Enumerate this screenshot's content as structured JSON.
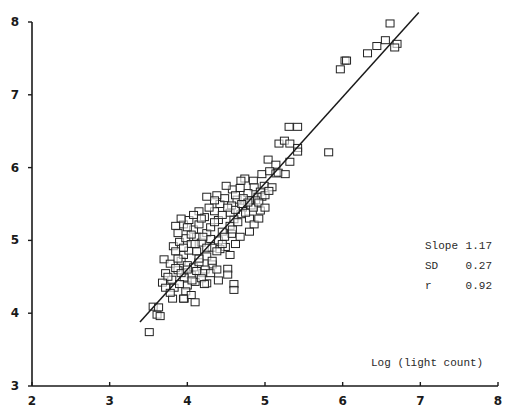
{
  "chart_data": {
    "type": "scatter",
    "title": "",
    "xlabel": "Log (light count)",
    "ylabel": "",
    "xlim": [
      2,
      8
    ],
    "ylim": [
      3,
      8
    ],
    "xticks": [
      2,
      3,
      4,
      5,
      6,
      7,
      8
    ],
    "yticks": [
      3,
      4,
      5,
      6,
      7,
      8
    ],
    "grid": false,
    "legend": null,
    "marker": "open-square",
    "regression_line": {
      "x": [
        3.39,
        6.98
      ],
      "y": [
        3.88,
        8.13
      ],
      "slope": 1.17
    },
    "annotations": [
      {
        "label": "Slope",
        "value": "1.17"
      },
      {
        "label": "SD",
        "value": "0.27"
      },
      {
        "label": "r",
        "value": "0.92"
      }
    ],
    "points": [
      [
        6.61,
        7.98
      ],
      [
        6.55,
        7.75
      ],
      [
        6.7,
        7.7
      ],
      [
        6.67,
        7.65
      ],
      [
        6.44,
        7.67
      ],
      [
        6.32,
        7.57
      ],
      [
        6.03,
        7.47
      ],
      [
        6.05,
        7.47
      ],
      [
        5.97,
        7.35
      ],
      [
        5.31,
        6.56
      ],
      [
        5.42,
        6.56
      ],
      [
        5.18,
        6.33
      ],
      [
        5.25,
        6.37
      ],
      [
        5.32,
        6.33
      ],
      [
        5.42,
        6.27
      ],
      [
        5.42,
        6.22
      ],
      [
        5.82,
        6.21
      ],
      [
        5.04,
        6.11
      ],
      [
        5.14,
        6.04
      ],
      [
        5.32,
        6.08
      ],
      [
        4.96,
        5.91
      ],
      [
        5.06,
        5.95
      ],
      [
        5.14,
        5.92
      ],
      [
        5.17,
        5.93
      ],
      [
        5.26,
        5.91
      ],
      [
        4.74,
        5.85
      ],
      [
        4.85,
        5.82
      ],
      [
        4.69,
        5.82
      ],
      [
        4.86,
        5.73
      ],
      [
        4.99,
        5.75
      ],
      [
        4.94,
        5.67
      ],
      [
        5.09,
        5.73
      ],
      [
        4.91,
        5.6
      ],
      [
        4.96,
        5.6
      ],
      [
        4.58,
        5.7
      ],
      [
        4.64,
        5.56
      ],
      [
        4.78,
        5.65
      ],
      [
        4.88,
        5.55
      ],
      [
        4.94,
        5.41
      ],
      [
        4.82,
        5.48
      ],
      [
        4.57,
        5.48
      ],
      [
        4.71,
        5.45
      ],
      [
        4.8,
        5.3
      ],
      [
        4.8,
        5.55
      ],
      [
        4.86,
        5.22
      ],
      [
        4.69,
        5.36
      ],
      [
        4.6,
        5.29
      ],
      [
        4.57,
        5.09
      ],
      [
        4.49,
        4.91
      ],
      [
        4.32,
        4.9
      ],
      [
        4.42,
        4.88
      ],
      [
        4.52,
        4.61
      ],
      [
        4.52,
        4.53
      ],
      [
        4.32,
        4.67
      ],
      [
        4.23,
        4.6
      ],
      [
        3.51,
        3.74
      ],
      [
        3.56,
        4.09
      ],
      [
        3.61,
        3.98
      ],
      [
        3.65,
        3.96
      ],
      [
        3.63,
        4.08
      ],
      [
        3.81,
        4.2
      ],
      [
        3.96,
        4.2
      ],
      [
        4.6,
        4.4
      ],
      [
        4.6,
        4.32
      ],
      [
        4.25,
        4.41
      ],
      [
        4.05,
        4.53
      ],
      [
        3.8,
        4.46
      ],
      [
        3.72,
        4.55
      ],
      [
        3.88,
        4.59
      ],
      [
        3.96,
        4.49
      ],
      [
        4.1,
        4.43
      ],
      [
        3.7,
        4.74
      ],
      [
        3.78,
        4.68
      ],
      [
        3.85,
        4.62
      ],
      [
        3.92,
        4.72
      ],
      [
        4.0,
        4.66
      ],
      [
        4.08,
        4.63
      ],
      [
        4.15,
        4.7
      ],
      [
        4.2,
        4.55
      ],
      [
        3.95,
        4.8
      ],
      [
        4.02,
        4.86
      ],
      [
        3.82,
        4.92
      ],
      [
        3.9,
        4.98
      ],
      [
        3.98,
        5.03
      ],
      [
        4.05,
        4.95
      ],
      [
        4.12,
        5.05
      ],
      [
        4.18,
        4.97
      ],
      [
        4.25,
        5.1
      ],
      [
        4.08,
        5.15
      ],
      [
        3.88,
        5.1
      ],
      [
        3.95,
        5.22
      ],
      [
        4.02,
        5.28
      ],
      [
        4.15,
        5.22
      ],
      [
        4.22,
        5.32
      ],
      [
        4.3,
        5.18
      ],
      [
        4.35,
        5.4
      ],
      [
        4.4,
        5.28
      ],
      [
        4.45,
        5.12
      ],
      [
        4.28,
        5.45
      ],
      [
        4.15,
        5.4
      ],
      [
        4.42,
        5.5
      ],
      [
        4.48,
        5.58
      ],
      [
        4.55,
        5.38
      ],
      [
        4.38,
        5.62
      ],
      [
        4.5,
        5.75
      ],
      [
        4.62,
        5.62
      ],
      [
        4.68,
        5.72
      ],
      [
        4.72,
        5.58
      ],
      [
        4.3,
        5.02
      ],
      [
        4.38,
        4.85
      ],
      [
        4.12,
        4.85
      ],
      [
        3.75,
        4.5
      ],
      [
        3.83,
        4.35
      ],
      [
        3.9,
        4.4
      ],
      [
        4.0,
        4.38
      ],
      [
        4.06,
        4.45
      ],
      [
        3.92,
        4.55
      ],
      [
        4.0,
        4.6
      ],
      [
        4.12,
        4.58
      ],
      [
        4.18,
        4.48
      ],
      [
        3.98,
        4.3
      ],
      [
        3.68,
        4.42
      ],
      [
        3.72,
        4.35
      ],
      [
        3.78,
        4.28
      ],
      [
        4.1,
        4.95
      ],
      [
        4.2,
        5.05
      ],
      [
        4.35,
        5.25
      ],
      [
        4.45,
        5.35
      ],
      [
        4.55,
        5.2
      ],
      [
        4.62,
        5.42
      ],
      [
        4.4,
        5.0
      ],
      [
        4.05,
        5.08
      ],
      [
        3.85,
        4.85
      ],
      [
        3.95,
        4.9
      ],
      [
        4.25,
        4.78
      ],
      [
        4.32,
        4.72
      ],
      [
        4.48,
        5.05
      ],
      [
        4.58,
        5.15
      ],
      [
        4.65,
        5.25
      ],
      [
        4.75,
        5.38
      ],
      [
        4.85,
        5.45
      ],
      [
        4.92,
        5.52
      ],
      [
        5.0,
        5.62
      ],
      [
        5.05,
        5.68
      ],
      [
        4.78,
        5.52
      ],
      [
        4.7,
        5.5
      ],
      [
        4.52,
        5.45
      ],
      [
        4.35,
        5.55
      ],
      [
        4.25,
        5.6
      ],
      [
        4.18,
        5.3
      ],
      [
        4.08,
        5.35
      ],
      [
        4.0,
        5.18
      ],
      [
        3.92,
        5.3
      ],
      [
        3.85,
        5.2
      ],
      [
        3.88,
        4.75
      ],
      [
        4.15,
        4.75
      ],
      [
        4.25,
        4.9
      ],
      [
        4.45,
        4.95
      ],
      [
        4.55,
        4.8
      ],
      [
        4.68,
        5.05
      ],
      [
        4.3,
        4.55
      ],
      [
        4.38,
        4.6
      ],
      [
        4.22,
        4.4
      ],
      [
        4.05,
        4.25
      ],
      [
        3.95,
        4.2
      ],
      [
        4.1,
        4.15
      ],
      [
        4.4,
        4.45
      ],
      [
        4.62,
        4.95
      ],
      [
        4.8,
        5.12
      ],
      [
        4.92,
        5.3
      ],
      [
        5.0,
        5.45
      ]
    ]
  }
}
